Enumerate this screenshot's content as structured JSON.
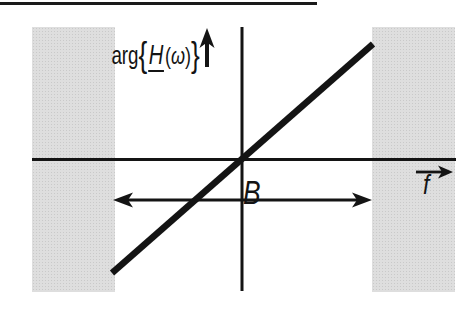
{
  "figure": {
    "colors": {
      "ink": "#141414",
      "stopband_fill": "#dedede",
      "background": "#ffffff"
    },
    "y_axis_label": {
      "function": "arg",
      "open_brace": "{",
      "symbol": "H",
      "open_paren": "(",
      "variable": "ω",
      "close_paren": ")",
      "close_brace": "}"
    },
    "x_axis_label": "f",
    "bandwidth_label": "B",
    "icons": {
      "y_axis_arrow": "up-arrow",
      "x_axis_arrow": "right-arrow",
      "bandwidth_span_arrow": "double-headed-arrow"
    }
  }
}
